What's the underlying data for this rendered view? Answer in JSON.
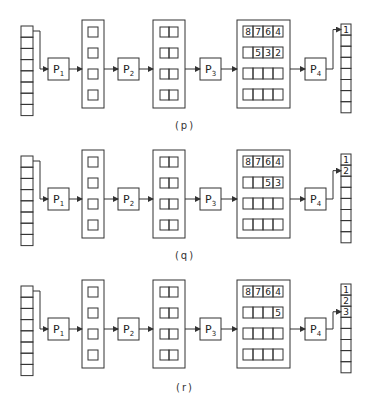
{
  "figure": {
    "panels": [
      {
        "id": "p",
        "caption": "(p)",
        "offset_y": 0,
        "processors": [
          "P1",
          "P2",
          "P3",
          "P4"
        ],
        "quad_rows": [
          [
            "8",
            "7",
            "6",
            "4"
          ],
          [
            "",
            "5",
            "3",
            "2"
          ],
          [
            "",
            "",
            "",
            ""
          ],
          [
            "",
            "",
            "",
            ""
          ]
        ],
        "output_cells": [
          "1",
          "",
          "",
          "",
          "",
          "",
          "",
          ""
        ],
        "output_arrow_row": 0
      },
      {
        "id": "q",
        "caption": "(q)",
        "offset_y": 130,
        "processors": [
          "P1",
          "P2",
          "P3",
          "P4"
        ],
        "quad_rows": [
          [
            "8",
            "7",
            "6",
            "4"
          ],
          [
            "",
            "",
            "5",
            "3"
          ],
          [
            "",
            "",
            "",
            ""
          ],
          [
            "",
            "",
            "",
            ""
          ]
        ],
        "output_cells": [
          "1",
          "2",
          "",
          "",
          "",
          "",
          "",
          ""
        ],
        "output_arrow_row": 1
      },
      {
        "id": "r",
        "caption": "(r)",
        "offset_y": 260,
        "processors": [
          "P1",
          "P2",
          "P3",
          "P4"
        ],
        "quad_rows": [
          [
            "8",
            "7",
            "6",
            "4"
          ],
          [
            "",
            "",
            "",
            "5"
          ],
          [
            "",
            "",
            "",
            ""
          ],
          [
            "",
            "",
            "",
            ""
          ]
        ],
        "output_cells": [
          "1",
          "2",
          "3",
          "",
          "",
          "",
          "",
          ""
        ],
        "output_arrow_row": 2
      }
    ],
    "input_cell_count": 8,
    "single_box_count": 4,
    "double_box_count": 4,
    "colors": {
      "stroke": "#333333",
      "background": "#ffffff"
    }
  }
}
